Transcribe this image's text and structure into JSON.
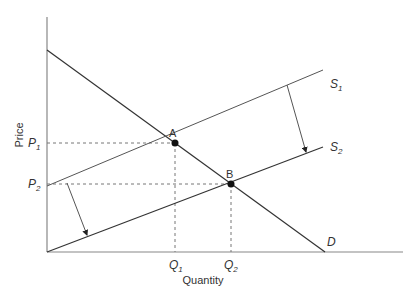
{
  "diagram": {
    "axes": {
      "x_label": "Quantity",
      "y_label": "Price"
    },
    "curves": {
      "demand": {
        "label": "D"
      },
      "supply_1": {
        "label": "S",
        "sub": "1"
      },
      "supply_2": {
        "label": "S",
        "sub": "2"
      }
    },
    "points": {
      "A": {
        "label": "A"
      },
      "B": {
        "label": "B"
      }
    },
    "ticks": {
      "p1": {
        "label": "P",
        "sub": "1"
      },
      "p2": {
        "label": "P",
        "sub": "2"
      },
      "q1": {
        "label": "Q",
        "sub": "1"
      },
      "q2": {
        "label": "Q",
        "sub": "2"
      }
    },
    "colors": {
      "line": "#333333",
      "axis": "#888888",
      "dash": "#777777"
    }
  }
}
